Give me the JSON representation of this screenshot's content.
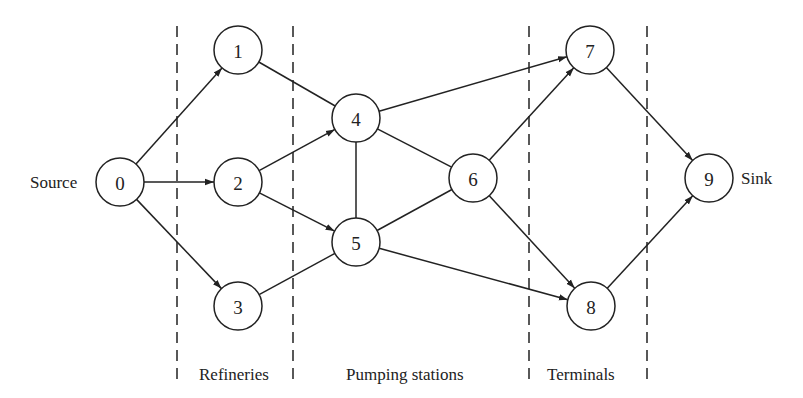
{
  "nodes": [
    {
      "id": "0",
      "label": "0"
    },
    {
      "id": "1",
      "label": "1"
    },
    {
      "id": "2",
      "label": "2"
    },
    {
      "id": "3",
      "label": "3"
    },
    {
      "id": "4",
      "label": "4"
    },
    {
      "id": "5",
      "label": "5"
    },
    {
      "id": "6",
      "label": "6"
    },
    {
      "id": "7",
      "label": "7"
    },
    {
      "id": "8",
      "label": "8"
    },
    {
      "id": "9",
      "label": "9"
    }
  ],
  "edges": [
    {
      "from": "0",
      "to": "1",
      "directed": true
    },
    {
      "from": "0",
      "to": "2",
      "directed": true
    },
    {
      "from": "0",
      "to": "3",
      "directed": true
    },
    {
      "from": "1",
      "to": "4",
      "directed": false
    },
    {
      "from": "2",
      "to": "4",
      "directed": true
    },
    {
      "from": "2",
      "to": "5",
      "directed": true
    },
    {
      "from": "3",
      "to": "5",
      "directed": false
    },
    {
      "from": "4",
      "to": "5",
      "directed": false
    },
    {
      "from": "4",
      "to": "6",
      "directed": false
    },
    {
      "from": "5",
      "to": "6",
      "directed": false
    },
    {
      "from": "4",
      "to": "7",
      "directed": true
    },
    {
      "from": "6",
      "to": "7",
      "directed": true
    },
    {
      "from": "6",
      "to": "8",
      "directed": true
    },
    {
      "from": "5",
      "to": "8",
      "directed": true
    },
    {
      "from": "7",
      "to": "9",
      "directed": true
    },
    {
      "from": "8",
      "to": "9",
      "directed": true
    }
  ],
  "labels": {
    "source": "Source",
    "sink": "Sink",
    "refineries": "Refineries",
    "pumping_stations": "Pumping stations",
    "terminals": "Terminals"
  }
}
